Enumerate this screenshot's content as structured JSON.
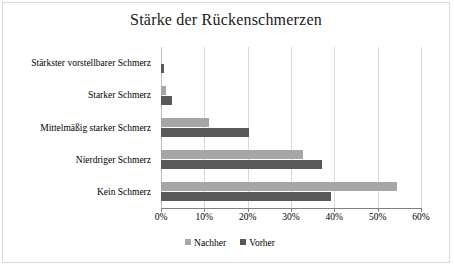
{
  "chart_data": {
    "type": "bar",
    "orientation": "horizontal",
    "title": "Stärke der Rückenschmerzen",
    "xlabel": "",
    "ylabel": "",
    "xlim": [
      0,
      60
    ],
    "x_tick_labels": [
      "0%",
      "10%",
      "20%",
      "30%",
      "40%",
      "50%",
      "60%"
    ],
    "x_ticks": [
      0,
      10,
      20,
      30,
      40,
      50,
      60
    ],
    "grid": "vertical",
    "legend_position": "bottom",
    "categories": [
      "Stärkster vorstellbarer Schmerz",
      "Starker Schmerz",
      "Mittelmäßig starker Schmerz",
      "Nierdriger Schmerz",
      "Kein Schmerz"
    ],
    "series": [
      {
        "name": "Nachher",
        "color": "#a6a6a6",
        "values": [
          0,
          1.2,
          11,
          32.8,
          54.5
        ]
      },
      {
        "name": "Vorher",
        "color": "#595959",
        "values": [
          0.7,
          2.5,
          20.2,
          37.2,
          39.2
        ]
      }
    ]
  },
  "colors": {
    "nachher": "#a6a6a6",
    "vorher": "#595959",
    "gridline": "#d9d9d9",
    "axis": "#808080",
    "frame": "#d9d9d9",
    "text": "#000000"
  }
}
